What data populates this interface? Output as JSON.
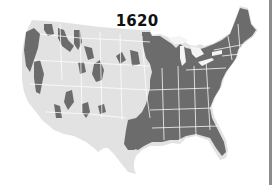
{
  "map": {
    "title": "1620",
    "region": "Contiguous United States",
    "legend_semantics": {
      "dark_gray": "forested area",
      "light_gray": "non-forested area",
      "white_lines": "state borders"
    },
    "colors": {
      "forest": "#6e6e6e",
      "land": "#e4e4e4",
      "borders": "#ffffff",
      "background": "#ffffff",
      "frame_edge": "#8c8c8c",
      "title": "#111111"
    }
  }
}
